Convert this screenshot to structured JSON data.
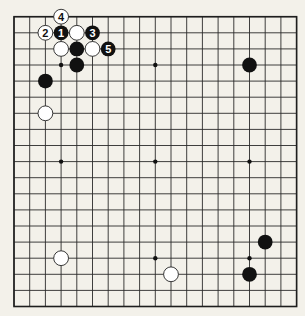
{
  "board": {
    "size": 19,
    "origin": {
      "x": 14,
      "y": 16.7
    },
    "spacing": {
      "x": 15.7,
      "y": 16.1
    },
    "colors": {
      "background": "#f3f1ea",
      "line": "#2a2a2a",
      "black": "#111111",
      "white": "#ffffff"
    },
    "hoshi": [
      {
        "col": 3,
        "row": 3
      },
      {
        "col": 9,
        "row": 3
      },
      {
        "col": 15,
        "row": 3
      },
      {
        "col": 3,
        "row": 9
      },
      {
        "col": 9,
        "row": 9
      },
      {
        "col": 15,
        "row": 9
      },
      {
        "col": 3,
        "row": 15
      },
      {
        "col": 9,
        "row": 15
      },
      {
        "col": 15,
        "row": 15
      }
    ],
    "stones": [
      {
        "color": "white",
        "col": 3,
        "row": 0,
        "label": "4"
      },
      {
        "color": "white",
        "col": 2,
        "row": 1,
        "label": "2"
      },
      {
        "color": "black",
        "col": 3,
        "row": 1,
        "label": "1"
      },
      {
        "color": "white",
        "col": 4,
        "row": 1,
        "label": ""
      },
      {
        "color": "black",
        "col": 5,
        "row": 1,
        "label": "3"
      },
      {
        "color": "white",
        "col": 3,
        "row": 2,
        "label": ""
      },
      {
        "color": "black",
        "col": 4,
        "row": 2,
        "label": ""
      },
      {
        "color": "white",
        "col": 5,
        "row": 2,
        "label": ""
      },
      {
        "color": "black",
        "col": 6,
        "row": 2,
        "label": "5"
      },
      {
        "color": "black",
        "col": 4,
        "row": 3,
        "label": ""
      },
      {
        "color": "black",
        "col": 2,
        "row": 4,
        "label": ""
      },
      {
        "color": "white",
        "col": 2,
        "row": 6,
        "label": ""
      },
      {
        "color": "black",
        "col": 15,
        "row": 3,
        "label": ""
      },
      {
        "color": "black",
        "col": 16,
        "row": 14,
        "label": ""
      },
      {
        "color": "black",
        "col": 15,
        "row": 16,
        "label": ""
      },
      {
        "color": "white",
        "col": 3,
        "row": 15,
        "label": ""
      },
      {
        "color": "white",
        "col": 10,
        "row": 16,
        "label": ""
      }
    ]
  }
}
